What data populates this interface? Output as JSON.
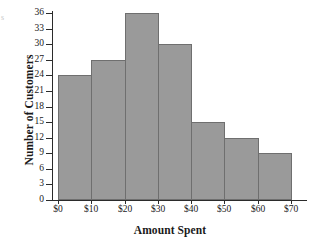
{
  "figure": {
    "artifact_glyph": "s",
    "background_color": "#ffffff"
  },
  "chart_data": {
    "type": "bar",
    "title": "",
    "subtitle": "",
    "xlabel": "Amount Spent",
    "ylabel": "Number of Customers",
    "categories": [
      "$0-$10",
      "$10-$20",
      "$20-$30",
      "$30-$40",
      "$40-$50",
      "$50-$60",
      "$60-$70"
    ],
    "values": [
      24,
      27,
      36,
      30,
      15,
      12,
      9
    ],
    "bin_edges": [
      "$0",
      "$10",
      "$20",
      "$30",
      "$40",
      "$50",
      "$60",
      "$70"
    ],
    "x_tick_labels": [
      "$0",
      "$10",
      "$20",
      "$30",
      "$40",
      "$50",
      "$60",
      "$70"
    ],
    "y_tick_labels": [
      "0",
      "3",
      "6",
      "9",
      "12",
      "15",
      "18",
      "21",
      "24",
      "27",
      "30",
      "33",
      "36"
    ],
    "y_tick_values": [
      0,
      3,
      6,
      9,
      12,
      15,
      18,
      21,
      24,
      27,
      30,
      33,
      36
    ],
    "ylim": [
      0,
      36
    ],
    "xlim": [
      0,
      70
    ],
    "grid": false,
    "legend": null,
    "legend_position": "none",
    "bar_fill_color": "#9a9a9a",
    "bar_edge_color": "#6f6f6f",
    "axis_color": "#2b2b2b",
    "annotations": []
  }
}
